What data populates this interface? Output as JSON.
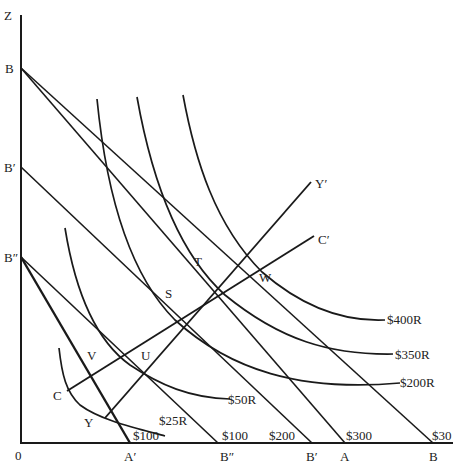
{
  "diagram": {
    "type": "indifference-curve / budget-line economics diagram",
    "axes": {
      "vertical_label": "Z",
      "origin_label": "0"
    },
    "vertical_intercepts": [
      {
        "id": "B",
        "label": "B"
      },
      {
        "id": "B_prime",
        "label": "B′"
      },
      {
        "id": "B_double_prime",
        "label": "B″"
      }
    ],
    "horizontal_intercepts": [
      {
        "id": "A_prime",
        "label": "A′",
        "value_label": "$100"
      },
      {
        "id": "B_double_prime_x",
        "label": "B″",
        "value_label": "$100"
      },
      {
        "id": "B_prime_x",
        "label": "B′",
        "value_label": "$200"
      },
      {
        "id": "A",
        "label": "A",
        "value_label": "$300"
      },
      {
        "id": "B_x",
        "label": "B",
        "value_label": "$30"
      }
    ],
    "indifference_curves": [
      {
        "id": "ic_25",
        "label": "$25R"
      },
      {
        "id": "ic_50",
        "label": "$50R"
      },
      {
        "id": "ic_200",
        "label": "$200R"
      },
      {
        "id": "ic_350",
        "label": "$350R"
      },
      {
        "id": "ic_400",
        "label": "$400R"
      }
    ],
    "expansion_paths": [
      {
        "id": "yy",
        "start_label": "Y",
        "end_label": "Y′"
      },
      {
        "id": "cc",
        "start_label": "C",
        "end_label": "C′"
      }
    ],
    "points": [
      {
        "id": "V",
        "label": "V"
      },
      {
        "id": "U",
        "label": "U"
      },
      {
        "id": "S",
        "label": "S"
      },
      {
        "id": "T",
        "label": "T"
      },
      {
        "id": "W",
        "label": "W"
      }
    ],
    "colors": {
      "ink": "#1a1a1a",
      "background": "#ffffff"
    }
  }
}
